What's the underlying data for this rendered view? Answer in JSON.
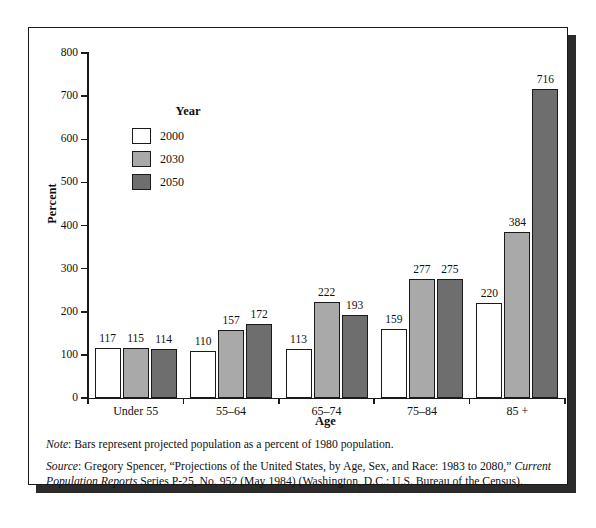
{
  "chart_data": {
    "type": "bar",
    "title": "",
    "xlabel": "Age",
    "ylabel": "Percent",
    "ylim": [
      0,
      800
    ],
    "yticks": [
      0,
      100,
      200,
      300,
      400,
      500,
      600,
      700,
      800
    ],
    "grid": false,
    "legend_position": "inside-upper-left",
    "legend_title": "Year",
    "categories": [
      "Under 55",
      "55–64",
      "65–74",
      "75–84",
      "85 +"
    ],
    "series": [
      {
        "name": "2000",
        "color": "#ffffff",
        "values": [
          117,
          110,
          113,
          159,
          220
        ]
      },
      {
        "name": "2030",
        "color": "#a9a9a9",
        "values": [
          115,
          157,
          222,
          277,
          384
        ]
      },
      {
        "name": "2050",
        "color": "#6e6e6e",
        "values": [
          114,
          172,
          193,
          275,
          716
        ]
      }
    ]
  },
  "axes": {
    "y_title": "Percent",
    "x_title": "Age",
    "y_tick_labels": [
      "0",
      "100",
      "200",
      "300",
      "400",
      "500",
      "600",
      "700",
      "800"
    ],
    "x_tick_labels": [
      "Under 55",
      "55–64",
      "65–74",
      "75–84",
      "85 +"
    ]
  },
  "legend": {
    "title": "Year",
    "entries": [
      {
        "label": "2000",
        "swatch": "#ffffff"
      },
      {
        "label": "2030",
        "swatch": "#a9a9a9"
      },
      {
        "label": "2050",
        "swatch": "#6e6e6e"
      }
    ]
  },
  "notes": {
    "note_lead": "Note",
    "note_text": ": Bars represent projected population as a percent of 1980 population.",
    "source_lead": "Source",
    "source_part1": ": Gregory Spencer, “Projections of the United States, by Age, Sex, and Race: 1983 to 2080,” ",
    "source_italic": "Current Population Reports",
    "source_part2": " Series P-25, No. 952 (May 1984) (Washington, D.C.: U.S. Bureau of the Census)."
  },
  "colors": {
    "frame_border": "#1a1a1a",
    "shadow": "#2b2b2b",
    "text": "#101010",
    "series_2000": "#ffffff",
    "series_2030": "#a9a9a9",
    "series_2050": "#6e6e6e"
  }
}
